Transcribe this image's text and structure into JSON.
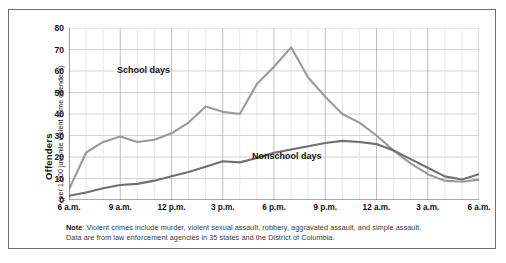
{
  "bleed": {
    "top_text": "",
    "bottom_text": ""
  },
  "chart_data": {
    "type": "line",
    "title": "",
    "xlabel": "",
    "ylabel": "Offenders",
    "ylabel_sub": "(per 1,000 juvenile violent crime offenders)",
    "ylim": [
      0,
      80
    ],
    "ytick_labels": [
      "0",
      "10",
      "20",
      "30",
      "40",
      "50",
      "60",
      "70",
      "80"
    ],
    "yticks": [
      0,
      10,
      20,
      30,
      40,
      50,
      60,
      70,
      80
    ],
    "xtick_labels": [
      "6 a.m.",
      "9 a.m.",
      "12 p.m.",
      "3 p.m.",
      "6 p.m.",
      "9 p.m.",
      "12 a.m.",
      "3 a.m.",
      "6 a.m."
    ],
    "xticks": [
      6,
      9,
      12,
      15,
      18,
      21,
      24,
      27,
      30
    ],
    "xlim": [
      6,
      30
    ],
    "grid": true,
    "minor_ticks_hourly": true,
    "legend_position": "inline-annotations",
    "x": [
      6,
      7,
      8,
      9,
      10,
      11,
      12,
      13,
      14,
      15,
      16,
      17,
      18,
      19,
      20,
      21,
      22,
      23,
      24,
      25,
      26,
      27,
      28,
      29,
      30
    ],
    "series": [
      {
        "name": "School days",
        "color": "#9a9a9a",
        "values": [
          5,
          22,
          27,
          29.5,
          27,
          28,
          31,
          36,
          43.5,
          41,
          40,
          54,
          62,
          71,
          57,
          48,
          40,
          36,
          30,
          23,
          17,
          12,
          9,
          8.5,
          9.5
        ]
      },
      {
        "name": "Nonschool days",
        "color": "#707070",
        "values": [
          2,
          3.5,
          5.5,
          7,
          7.5,
          9,
          11,
          13,
          15.5,
          18,
          17.5,
          19.5,
          22,
          23.5,
          25,
          26.5,
          27.5,
          27,
          26,
          23,
          19,
          15,
          11,
          9.5,
          12
        ]
      }
    ],
    "annotations": [
      {
        "text": "School days",
        "x": 9.9,
        "y": 54
      },
      {
        "text": "Nonschool days",
        "x": 20.1,
        "y": 20.5
      }
    ]
  },
  "note": {
    "label": "Note",
    "line1": ": Violent crimes include murder, violent sexual assault, robbery, aggravated assault, and simple assault.",
    "line2": "Data are from law enforcement agencies in 35 states and the District of Columbia."
  }
}
